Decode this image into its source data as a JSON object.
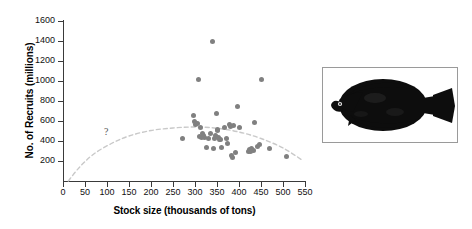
{
  "figure": {
    "background": "#ffffff",
    "point_color": "#808080",
    "curve_color": "#c9c9c9",
    "axis_color": "#3a3a3a"
  },
  "annotations": {
    "question_mark": "?"
  },
  "photo": {
    "caption_none": "",
    "alt_name": "flatfish-plaice-photo",
    "body_color": "#0d0d0d",
    "border_color": "#9a9a9a"
  },
  "chart_data": {
    "type": "scatter",
    "title": "",
    "xlabel": "Stock size (thousands of tons)",
    "ylabel": "No. of Recruits (millions)",
    "xlim": [
      0,
      550
    ],
    "ylim": [
      0,
      1600
    ],
    "xticks": [
      0,
      50,
      100,
      150,
      200,
      250,
      300,
      350,
      400,
      450,
      500,
      550
    ],
    "yticks": [
      200,
      400,
      600,
      800,
      1000,
      1200,
      1400,
      1600
    ],
    "grid": false,
    "legend": null,
    "series": [
      {
        "name": "Stock vs recruits",
        "marker": "circle",
        "color": "#808080",
        "points": [
          [
            272,
            430
          ],
          [
            296,
            655
          ],
          [
            299,
            592
          ],
          [
            302,
            565
          ],
          [
            305,
            575
          ],
          [
            308,
            1015
          ],
          [
            311,
            445
          ],
          [
            313,
            540
          ],
          [
            315,
            432
          ],
          [
            318,
            478
          ],
          [
            320,
            455
          ],
          [
            322,
            438
          ],
          [
            326,
            340
          ],
          [
            331,
            425
          ],
          [
            336,
            480
          ],
          [
            339,
            1395
          ],
          [
            341,
            330
          ],
          [
            344,
            430
          ],
          [
            346,
            455
          ],
          [
            348,
            680
          ],
          [
            350,
            520
          ],
          [
            352,
            508
          ],
          [
            354,
            432
          ],
          [
            356,
            420
          ],
          [
            358,
            412
          ],
          [
            361,
            336
          ],
          [
            366,
            540
          ],
          [
            371,
            428
          ],
          [
            374,
            380
          ],
          [
            378,
            570
          ],
          [
            381,
            545
          ],
          [
            384,
            260
          ],
          [
            386,
            240
          ],
          [
            388,
            552
          ],
          [
            391,
            288
          ],
          [
            397,
            748
          ],
          [
            402,
            535
          ],
          [
            421,
            300
          ],
          [
            424,
            315
          ],
          [
            427,
            292
          ],
          [
            429,
            330
          ],
          [
            432,
            305
          ],
          [
            435,
            590
          ],
          [
            442,
            348
          ],
          [
            447,
            362
          ],
          [
            451,
            1015
          ],
          [
            470,
            328
          ],
          [
            508,
            245
          ]
        ]
      }
    ],
    "fitted_curve": {
      "name": "stock-recruitment relationship",
      "style": "dashed",
      "color": "#c9c9c9",
      "points": [
        [
          12,
          0
        ],
        [
          40,
          150
        ],
        [
          70,
          270
        ],
        [
          110,
          375
        ],
        [
          150,
          450
        ],
        [
          200,
          505
        ],
        [
          250,
          530
        ],
        [
          300,
          540
        ],
        [
          350,
          528
        ],
        [
          400,
          490
        ],
        [
          450,
          425
        ],
        [
          500,
          330
        ],
        [
          545,
          205
        ]
      ]
    },
    "annotations": [
      {
        "text": "?",
        "x": 100,
        "y": 490
      }
    ]
  }
}
